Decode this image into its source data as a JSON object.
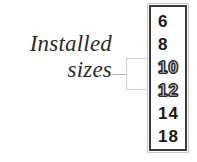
{
  "annotation": {
    "lines": [
      "Installed",
      "sizes"
    ],
    "leader": "leader-line",
    "bracket": "bracket-callout"
  },
  "size_listbox": {
    "name": "font-size-list",
    "items": [
      {
        "label": "6",
        "style": "solid"
      },
      {
        "label": "8",
        "style": "solid"
      },
      {
        "label": "10",
        "style": "outline"
      },
      {
        "label": "12",
        "style": "outline"
      },
      {
        "label": "14",
        "style": "solid"
      },
      {
        "label": "18",
        "style": "solid"
      }
    ]
  },
  "colors": {
    "text": "#1a1a1a",
    "annotation_text": "#2b2b2b",
    "box_border": "#3a3a3a",
    "box_outer_border": "#c9c9c9",
    "callout_line": "#b9b9b9",
    "bracket": "#d2d2d2",
    "background": "#ffffff"
  }
}
